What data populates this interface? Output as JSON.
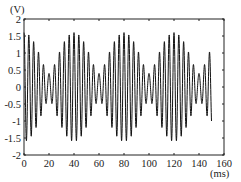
{
  "chart_data": {
    "type": "line",
    "title": "",
    "xlabel": "(ms)",
    "ylabel": "(V)",
    "xlim": [
      0,
      160
    ],
    "ylim": [
      -2,
      2
    ],
    "x_ticks": [
      0,
      20,
      40,
      60,
      80,
      100,
      120,
      140,
      160
    ],
    "x_tick_labels": [
      "0",
      "20",
      "40",
      "60",
      "80",
      "100",
      "120",
      "140",
      "160"
    ],
    "y_ticks": [
      2,
      1.5,
      1,
      0.5,
      0,
      -0.5,
      -1,
      -1.5,
      -2
    ],
    "y_tick_labels": [
      "2",
      "1.5",
      "1",
      "0.5",
      "0",
      "-0.5",
      "-1",
      "-1.5",
      "-2"
    ],
    "grid": false,
    "legend": null,
    "series": [
      {
        "name": "beat signal",
        "description": "Amplitude-modulated (beat) waveform: carrier period ~4 ms, envelope period ~40 ms, envelope max ~1.6 V at t=0,40,80,120 ms, min ~0.4 V at t=20,60,100,140 ms",
        "t_start_ms": 0,
        "t_end_ms": 150,
        "carrier_period_ms": 4,
        "beat_period_ms": 40,
        "envelope_max_v": 1.6,
        "envelope_min_v": 0.4,
        "color": "#111111"
      }
    ]
  }
}
